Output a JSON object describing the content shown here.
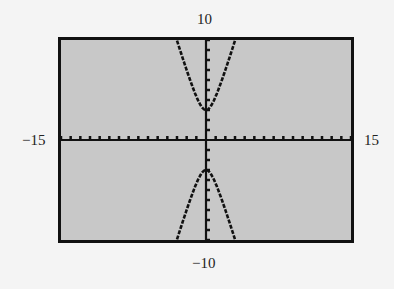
{
  "labels": {
    "ymax": "10",
    "ymin": "−10",
    "xmin": "−15",
    "xmax": "15"
  },
  "colors": {
    "screen_bg": "#c8c8c8",
    "ink": "#111111",
    "page_bg": "#f4f4f4"
  },
  "chart_data": {
    "type": "line",
    "title": "",
    "xlabel": "",
    "ylabel": "",
    "xlim": [
      -15,
      15
    ],
    "ylim": [
      -10,
      10
    ],
    "xscale": 1,
    "yscale": 1,
    "grid": false,
    "series": [
      {
        "name": "upper branch",
        "x": [
          -3,
          -2,
          -1,
          0,
          1,
          2,
          3
        ],
        "y": [
          9.95,
          7.0,
          4.36,
          3.0,
          4.36,
          7.0,
          9.95
        ]
      },
      {
        "name": "lower branch",
        "x": [
          -3,
          -2,
          -1,
          0,
          1,
          2,
          3
        ],
        "y": [
          -9.95,
          -7.0,
          -4.36,
          -3.0,
          -4.36,
          -7.0,
          -9.95
        ]
      }
    ]
  }
}
